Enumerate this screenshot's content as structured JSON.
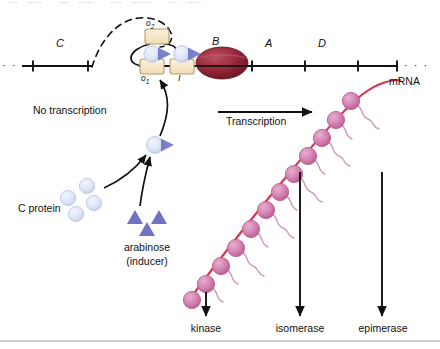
{
  "figure": {
    "background": "#ffffff"
  },
  "dna": {
    "ellipsis_left": "· · ·",
    "ellipsis_right": "· · ·",
    "genes": [
      {
        "label": "C",
        "x": 62,
        "y": 44
      },
      {
        "label": "B",
        "x": 215,
        "y": 42
      },
      {
        "label": "A",
        "x": 267,
        "y": 44
      },
      {
        "label": "D",
        "x": 320,
        "y": 44
      }
    ],
    "operators": [
      {
        "label": "o",
        "sub": "2",
        "position": "upper-left-box"
      },
      {
        "label": "o",
        "sub": "1",
        "position": "lower-left-box"
      }
    ],
    "promoter_label": "I"
  },
  "colors": {
    "dna_line": "#111111",
    "operator_box_fill": "#f6e3c4",
    "operator_box_stroke": "#b89a6a",
    "polymerase_fill": "#8e2230",
    "polymerase_highlight": "#b5424f",
    "c_protein_circle": "#dfe6f7",
    "c_protein_circle_stroke": "#b9c4e4",
    "c_protein_triangle": "#6f73c4",
    "arabinose_triangle": "#6f73c4",
    "mrna": "#d8344b",
    "ribosome_fill": "#d987b5",
    "ribosome_stroke": "#b55b92",
    "polypeptide": "#c79cc0",
    "rule": "#9a9a9a"
  },
  "labels": {
    "no_transcription": "No transcription",
    "transcription": "Transcription",
    "c_protein": "C protein",
    "arabinose": "arabinose",
    "inducer": "(inducer)",
    "mrna": "mRNA"
  },
  "products": [
    {
      "name": "kinase",
      "x": 206,
      "arrow_x": 206,
      "arrow_y1": 292,
      "arrow_y2": 318
    },
    {
      "name": "isomerase",
      "x": 300,
      "arrow_x": 300,
      "arrow_y1": 172,
      "arrow_y2": 318
    },
    {
      "name": "epimerase",
      "x": 382,
      "arrow_x": 382,
      "arrow_y1": 172,
      "arrow_y2": 318
    }
  ],
  "ribosomes": {
    "count": 12,
    "description": "ribosomes translating mRNA along a diagonal strand"
  }
}
